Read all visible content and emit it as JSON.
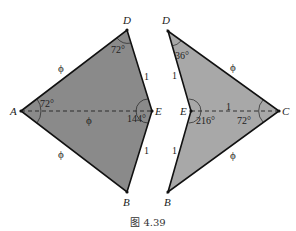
{
  "figure": {
    "caption": "图 4.39",
    "colors": {
      "kite_fill": "#8a8a8a",
      "dart_fill": "#a8a8a8",
      "stroke": "#111111"
    },
    "kite": {
      "vertices": {
        "A": "A",
        "D": "D",
        "E": "E",
        "B": "B"
      },
      "angles": {
        "A": "72°",
        "D": "72°",
        "E": "144°"
      },
      "sides": {
        "AD": "ϕ",
        "AB": "ϕ",
        "AE": "ϕ",
        "DE": "1",
        "EB": "1"
      }
    },
    "dart": {
      "vertices": {
        "D": "D",
        "E": "E",
        "C": "C",
        "B": "B"
      },
      "angles": {
        "D": "36°",
        "E": "216°",
        "C": "72°"
      },
      "sides": {
        "DC": "ϕ",
        "BC": "ϕ",
        "EC": "1",
        "DE": "1",
        "EB": "1"
      }
    }
  }
}
